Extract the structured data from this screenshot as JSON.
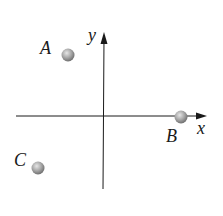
{
  "diagram": {
    "axes": {
      "x_label": "x",
      "y_label": "y",
      "axis_color": "#1a1a1a"
    },
    "points": [
      {
        "label": "A",
        "quadrant": "II",
        "color": "#9a9a9a"
      },
      {
        "label": "B",
        "quadrant": "positive x-axis",
        "color": "#9a9a9a"
      },
      {
        "label": "C",
        "quadrant": "III",
        "color": "#9a9a9a"
      }
    ]
  }
}
